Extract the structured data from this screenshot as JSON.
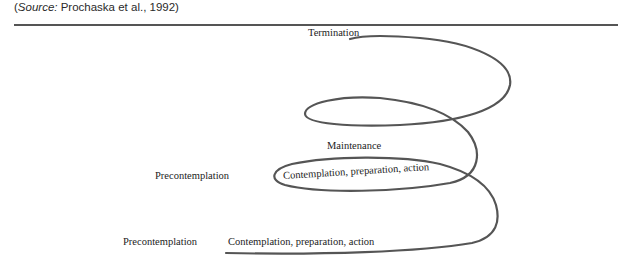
{
  "figure": {
    "source_prefix": "(",
    "source_italic": "Source:",
    "source_rest": " Prochaska et al., 1992)",
    "stroke_color": "#555555",
    "labels": {
      "termination": "Termination",
      "maintenance": "Maintenance",
      "precontemplation_upper": "Precontemplation",
      "contemplation_upper": "Contemplation, preparation, action",
      "precontemplation_lower": "Precontemplation",
      "contemplation_lower": "Contemplation, preparation, action"
    }
  }
}
